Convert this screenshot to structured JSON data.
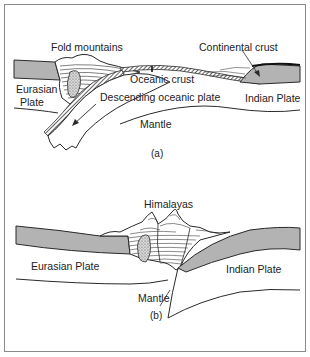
{
  "figure": {
    "colors": {
      "plate_fill": "#b3b3b3",
      "line": "#2a2a2a",
      "background": "#ffffff",
      "frame": "#8a8a8a"
    },
    "panel_a": {
      "caption": "(a)",
      "labels": {
        "fold_mountains": "Fold mountains",
        "continental_crust": "Continental crust",
        "oceanic_crust": "Oceanic crust",
        "eurasian_plate_line1": "Eurasian",
        "eurasian_plate_line2": "Plate",
        "descending_plate": "Descending oceanic plate",
        "indian_plate": "Indian Plate",
        "mantle": "Mantle"
      }
    },
    "panel_b": {
      "caption": "(b)",
      "labels": {
        "himalayas": "Himalayas",
        "eurasian_plate": "Eurasian Plate",
        "indian_plate": "Indian Plate",
        "mantle": "Mantle"
      }
    }
  }
}
